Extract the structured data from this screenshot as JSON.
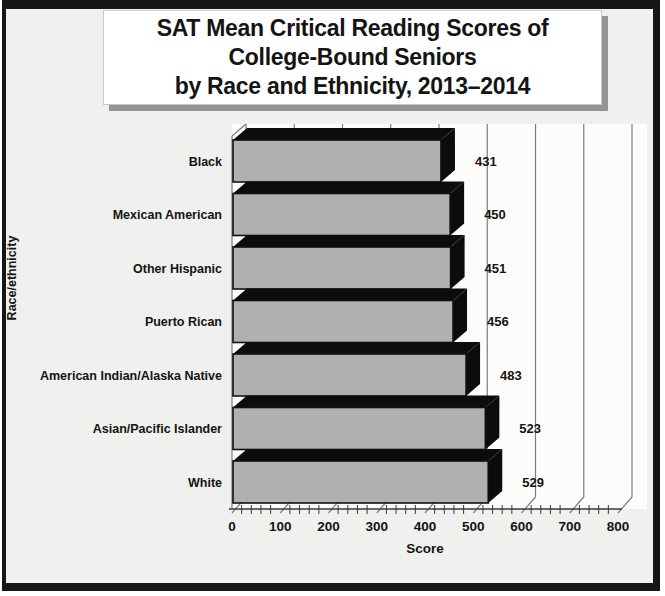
{
  "page": {
    "title_lines": [
      "SAT Mean Critical Reading Scores of",
      "College-Bound Seniors",
      "by Race and Ethnicity, 2013–2014"
    ]
  },
  "chart_data": {
    "type": "bar",
    "orientation": "horizontal",
    "style": "3d-black-depth",
    "title": "SAT Mean Critical Reading Scores of College-Bound Seniors by Race and Ethnicity, 2013–2014",
    "categories": [
      "Black",
      "Mexican American",
      "Other Hispanic",
      "Puerto Rican",
      "American Indian/Alaska Native",
      "Asian/Pacific Islander",
      "White"
    ],
    "values": [
      431,
      450,
      451,
      456,
      483,
      523,
      529
    ],
    "data_labels": [
      431,
      450,
      451,
      456,
      483,
      523,
      529
    ],
    "xlabel": "Score",
    "ylabel": "Race/ethnicity",
    "xlim": [
      0,
      800
    ],
    "x_ticks": [
      0,
      100,
      200,
      300,
      400,
      500,
      600,
      700,
      800
    ],
    "x_minor_tick_step": 20,
    "grid": "vertical-major",
    "legend": "none",
    "colors": {
      "bar_front": "#b0b0ae",
      "bar_depth": "#0c0c0c",
      "bar_outline": "#111111",
      "gridline": "#7d7d7d",
      "axis": "#3a3a3a",
      "text": "#141414",
      "plot_wall": "#fcfcfb",
      "page_background": "#f0f0ee",
      "frame_border": "#161616",
      "title_background": "#ffffff"
    }
  }
}
